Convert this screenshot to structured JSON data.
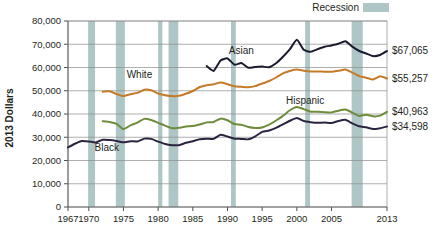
{
  "chart_data": {
    "type": "line",
    "title": "",
    "xlabel": "",
    "ylabel": "2013 Dollars",
    "xlim": [
      1967,
      2013
    ],
    "ylim": [
      0,
      80000
    ],
    "grid": true,
    "legend_position": "top-right",
    "x_tick_labels": [
      "1967",
      "1970",
      "1975",
      "1980",
      "1985",
      "1990",
      "1995",
      "2000",
      "2005",
      "2013"
    ],
    "x_tick_values": [
      1967,
      1970,
      1975,
      1980,
      1985,
      1990,
      1995,
      2000,
      2005,
      2013
    ],
    "y_tick_labels": [
      "0",
      "10,000",
      "20,000",
      "30,000",
      "40,000",
      "50,000",
      "60,000",
      "70,000",
      "80,000"
    ],
    "y_tick_values": [
      0,
      10000,
      20000,
      30000,
      40000,
      50000,
      60000,
      70000,
      80000
    ],
    "legend": [
      {
        "label": "Recession",
        "color": "#afc6c6",
        "type": "band"
      }
    ],
    "annotations": [
      {
        "text": "Asian",
        "x": 1992.0,
        "y": 65600
      },
      {
        "text": "White",
        "x": 1977.3,
        "y": 55300
      },
      {
        "text": "Hispanic",
        "x": 2001.2,
        "y": 44200
      },
      {
        "text": "Black",
        "x": 1972.6,
        "y": 24100
      }
    ],
    "end_labels": [
      {
        "series": "Asian",
        "text": "$67,065",
        "value": 67065,
        "color": "#1b1b2f"
      },
      {
        "series": "White",
        "text": "$55,257",
        "value": 55257,
        "color": "#c57a28"
      },
      {
        "series": "Hispanic",
        "text": "$40,963",
        "value": 40963,
        "color": "#6d8c3c"
      },
      {
        "series": "Black",
        "text": "$34,598",
        "value": 34598,
        "color": "#2b2440"
      }
    ],
    "recessions": [
      {
        "start": 1969.9,
        "end": 1970.9
      },
      {
        "start": 1973.9,
        "end": 1975.2
      },
      {
        "start": 1980.0,
        "end": 1980.6
      },
      {
        "start": 1981.5,
        "end": 1982.9
      },
      {
        "start": 1990.5,
        "end": 1991.2
      },
      {
        "start": 2001.2,
        "end": 2001.9
      },
      {
        "start": 2007.9,
        "end": 2009.5
      }
    ],
    "series": [
      {
        "name": "Asian",
        "color": "#1b1b2f",
        "x": [
          1987,
          1988,
          1989,
          1990,
          1991,
          1992,
          1993,
          1994,
          1995,
          1996,
          1997,
          1998,
          1999,
          2000,
          2001,
          2002,
          2003,
          2004,
          2005,
          2006,
          2007,
          2008,
          2009,
          2010,
          2011,
          2012,
          2013
        ],
        "values": [
          60600,
          58500,
          63000,
          63900,
          61200,
          61900,
          59900,
          60200,
          60400,
          60100,
          61800,
          64600,
          67900,
          71900,
          67600,
          66800,
          67900,
          68900,
          69500,
          70200,
          71300,
          69000,
          67100,
          66000,
          64900,
          65400,
          67065
        ]
      },
      {
        "name": "White",
        "color": "#c57a28",
        "x": [
          1972,
          1973,
          1974,
          1975,
          1976,
          1977,
          1978,
          1979,
          1980,
          1981,
          1982,
          1983,
          1984,
          1985,
          1986,
          1987,
          1988,
          1989,
          1990,
          1991,
          1992,
          1993,
          1994,
          1995,
          1996,
          1997,
          1998,
          1999,
          2000,
          2001,
          2002,
          2003,
          2004,
          2005,
          2006,
          2007,
          2008,
          2009,
          2010,
          2011,
          2012,
          2013
        ],
        "values": [
          49600,
          49800,
          48600,
          47700,
          48500,
          49100,
          50400,
          50200,
          48800,
          48100,
          47700,
          47800,
          48700,
          49900,
          51600,
          52400,
          52800,
          53500,
          52800,
          51900,
          51700,
          51500,
          52000,
          53100,
          54200,
          55700,
          57500,
          58500,
          59100,
          58600,
          58300,
          58300,
          58200,
          58200,
          58600,
          59100,
          57800,
          56300,
          55600,
          54800,
          56200,
          55257
        ]
      },
      {
        "name": "Hispanic",
        "color": "#6d8c3c",
        "x": [
          1972,
          1973,
          1974,
          1975,
          1976,
          1977,
          1978,
          1979,
          1980,
          1981,
          1982,
          1983,
          1984,
          1985,
          1986,
          1987,
          1988,
          1989,
          1990,
          1991,
          1992,
          1993,
          1994,
          1995,
          1996,
          1997,
          1998,
          1999,
          2000,
          2001,
          2002,
          2003,
          2004,
          2005,
          2006,
          2007,
          2008,
          2009,
          2010,
          2011,
          2012,
          2013
        ],
        "values": [
          36900,
          36600,
          35800,
          33500,
          35100,
          36300,
          37900,
          37400,
          36200,
          35000,
          33900,
          34100,
          34600,
          34800,
          35500,
          36400,
          36600,
          38000,
          37300,
          35700,
          35400,
          34400,
          34000,
          34200,
          35400,
          37200,
          39200,
          41600,
          43000,
          42100,
          41000,
          41000,
          40800,
          40700,
          41400,
          41900,
          40600,
          39100,
          39700,
          39000,
          39300,
          40963
        ]
      },
      {
        "name": "Black",
        "color": "#2b2440",
        "x": [
          1967,
          1968,
          1969,
          1970,
          1971,
          1972,
          1973,
          1974,
          1975,
          1976,
          1977,
          1978,
          1979,
          1980,
          1981,
          1982,
          1983,
          1984,
          1985,
          1986,
          1987,
          1988,
          1989,
          1990,
          1991,
          1992,
          1993,
          1994,
          1995,
          1996,
          1997,
          1998,
          1999,
          2000,
          2001,
          2002,
          2003,
          2004,
          2005,
          2006,
          2007,
          2008,
          2009,
          2010,
          2011,
          2012,
          2013
        ],
        "values": [
          25600,
          27200,
          28400,
          28200,
          27800,
          28900,
          28800,
          28400,
          27800,
          28300,
          28200,
          29400,
          29300,
          28100,
          27100,
          26600,
          26600,
          27600,
          28300,
          29100,
          29400,
          29300,
          31100,
          30300,
          29400,
          29300,
          29100,
          30400,
          32300,
          32900,
          34000,
          35500,
          37100,
          38300,
          37000,
          36500,
          36200,
          36300,
          36100,
          37000,
          37500,
          36000,
          34700,
          34300,
          33500,
          33900,
          34598
        ]
      }
    ]
  },
  "plot_geometry": {
    "left": 68,
    "right": 387,
    "top": 21,
    "bottom": 207
  },
  "legend_swatch": {
    "x": 363,
    "y": 3,
    "width": 26,
    "height": 9
  }
}
